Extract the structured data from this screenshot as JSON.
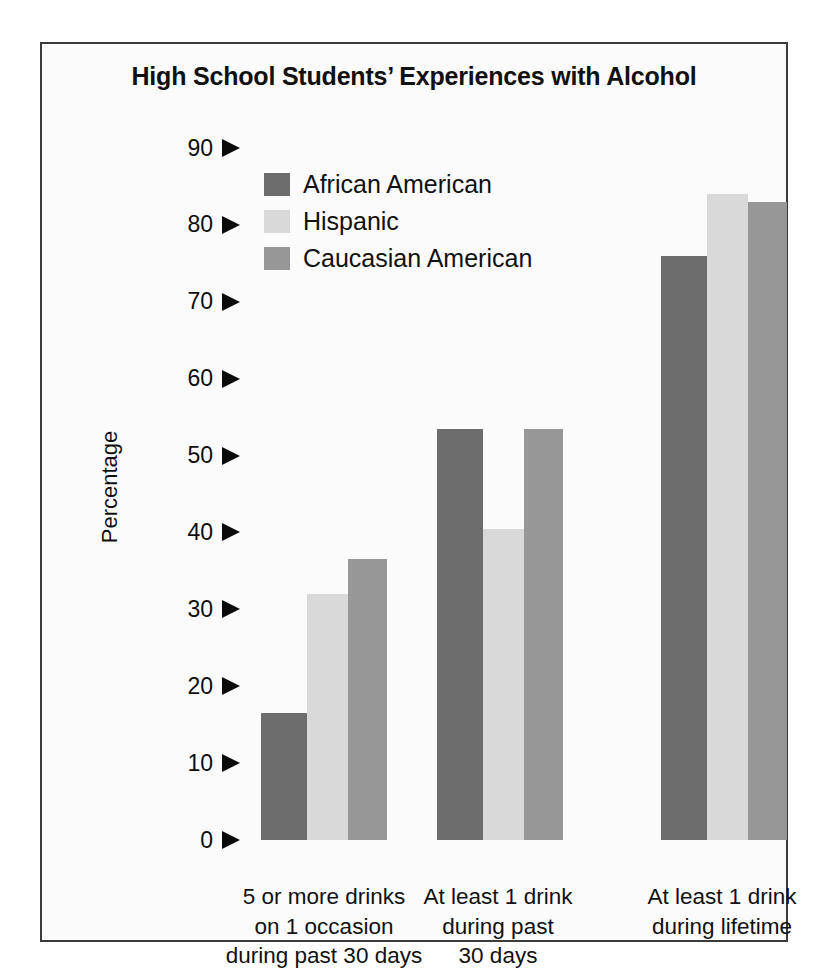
{
  "chart_data": {
    "type": "bar",
    "title": "High School Students’ Experiences with Alcohol",
    "xlabel": "",
    "ylabel": "Percentage",
    "ylim": [
      0,
      90
    ],
    "yticks": [
      0,
      10,
      20,
      30,
      40,
      50,
      60,
      70,
      80,
      90
    ],
    "ytick_labels": [
      "0",
      "10",
      "20",
      "30",
      "40",
      "50",
      "60",
      "70",
      "80",
      "90"
    ],
    "grid": false,
    "legend_position": "top-center",
    "categories": [
      "5 or more drinks on 1 occasion during past 30 days",
      "At least 1 drink during past 30 days",
      "At least 1 drink during lifetime"
    ],
    "category_lines": [
      [
        "5 or more drinks",
        "on 1 occasion",
        "during past 30 days"
      ],
      [
        "At least 1 drink",
        "during past",
        "30 days"
      ],
      [
        "At least 1 drink",
        "during lifetime"
      ]
    ],
    "series": [
      {
        "name": "African American",
        "color": "#6d6d6d",
        "values": [
          16.5,
          53.5,
          76.0
        ]
      },
      {
        "name": "Hispanic",
        "color": "#d9d9d9",
        "values": [
          32.0,
          40.5,
          84.0
        ]
      },
      {
        "name": "Caucasian American",
        "color": "#979797",
        "values": [
          36.5,
          53.5,
          83.0
        ]
      }
    ]
  },
  "figure": {
    "frame_color": "#3b3b3b",
    "background": "#fbfbfb"
  }
}
